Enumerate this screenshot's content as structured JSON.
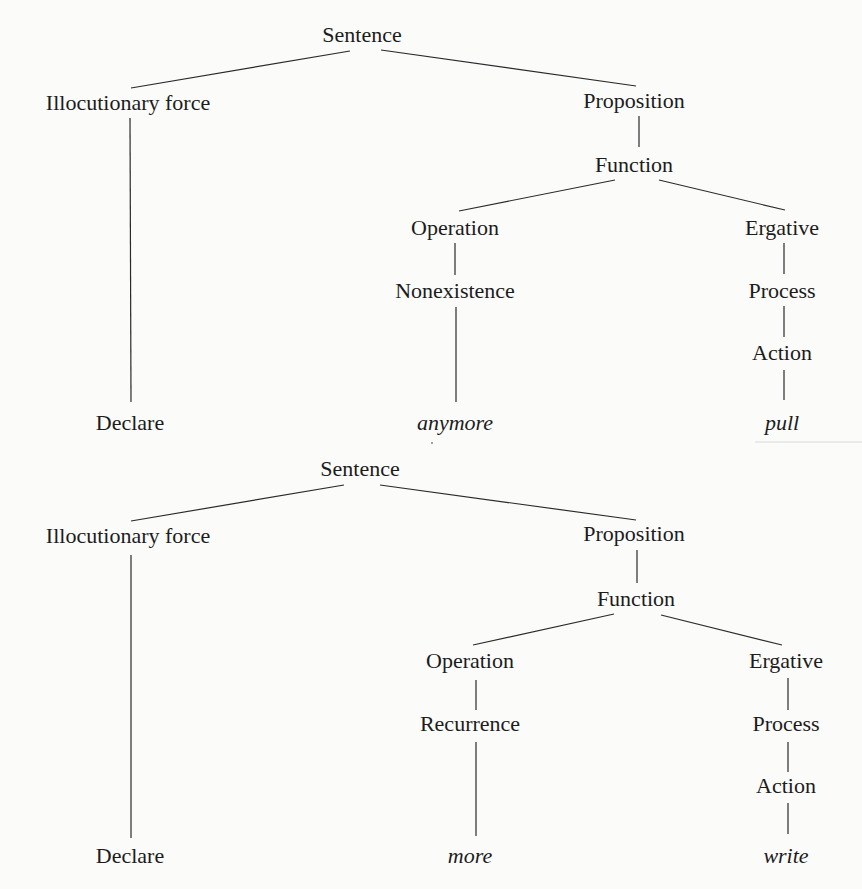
{
  "diagram": {
    "trees": [
      {
        "id": "tree-1",
        "offset_y": 0,
        "nodes": [
          {
            "id": "sentence",
            "label": "Sentence",
            "x": 362,
            "y": 42,
            "italic": false
          },
          {
            "id": "illocutionary-force",
            "label": "Illocutionary force",
            "x": 128,
            "y": 110,
            "italic": false
          },
          {
            "id": "proposition",
            "label": "Proposition",
            "x": 634,
            "y": 108,
            "italic": false
          },
          {
            "id": "function",
            "label": "Function",
            "x": 634,
            "y": 172,
            "italic": false
          },
          {
            "id": "operation",
            "label": "Operation",
            "x": 455,
            "y": 235,
            "italic": false
          },
          {
            "id": "ergative",
            "label": "Ergative",
            "x": 782,
            "y": 235,
            "italic": false
          },
          {
            "id": "nonexistence",
            "label": "Nonexistence",
            "x": 455,
            "y": 298,
            "italic": false
          },
          {
            "id": "process",
            "label": "Process",
            "x": 782,
            "y": 298,
            "italic": false
          },
          {
            "id": "action",
            "label": "Action",
            "x": 782,
            "y": 360,
            "italic": false
          },
          {
            "id": "declare",
            "label": "Declare",
            "x": 130,
            "y": 430,
            "italic": false
          },
          {
            "id": "anymore",
            "label": "anymore",
            "x": 455,
            "y": 430,
            "italic": true
          },
          {
            "id": "pull",
            "label": "pull",
            "x": 782,
            "y": 430,
            "italic": true
          }
        ],
        "edges": [
          {
            "from": "sentence",
            "to": "illocutionary-force",
            "x1": 350,
            "y1": 51,
            "x2": 131,
            "y2": 88
          },
          {
            "from": "sentence",
            "to": "proposition",
            "x1": 381,
            "y1": 50,
            "x2": 636,
            "y2": 86
          },
          {
            "from": "illocutionary-force",
            "to": "declare",
            "x1": 130,
            "y1": 118,
            "x2": 131,
            "y2": 402
          },
          {
            "from": "proposition",
            "to": "function",
            "x1": 639,
            "y1": 116,
            "x2": 639,
            "y2": 147
          },
          {
            "from": "function",
            "to": "operation",
            "x1": 615,
            "y1": 180,
            "x2": 459,
            "y2": 211
          },
          {
            "from": "function",
            "to": "ergative",
            "x1": 659,
            "y1": 180,
            "x2": 785,
            "y2": 210
          },
          {
            "from": "operation",
            "to": "nonexistence",
            "x1": 455,
            "y1": 243,
            "x2": 455,
            "y2": 275
          },
          {
            "from": "ergative",
            "to": "process",
            "x1": 784,
            "y1": 243,
            "x2": 784,
            "y2": 274
          },
          {
            "from": "nonexistence",
            "to": "anymore",
            "x1": 456,
            "y1": 307,
            "x2": 456,
            "y2": 402
          },
          {
            "from": "process",
            "to": "action",
            "x1": 784,
            "y1": 306,
            "x2": 784,
            "y2": 337
          },
          {
            "from": "action",
            "to": "pull",
            "x1": 784,
            "y1": 370,
            "x2": 784,
            "y2": 400
          }
        ]
      },
      {
        "id": "tree-2",
        "offset_y": 0,
        "nodes": [
          {
            "id": "sentence",
            "label": "Sentence",
            "x": 360,
            "y": 476,
            "italic": false
          },
          {
            "id": "illocutionary-force",
            "label": "Illocutionary force",
            "x": 128,
            "y": 543,
            "italic": false
          },
          {
            "id": "proposition",
            "label": "Proposition",
            "x": 634,
            "y": 541,
            "italic": false
          },
          {
            "id": "function",
            "label": "Function",
            "x": 636,
            "y": 606,
            "italic": false
          },
          {
            "id": "operation",
            "label": "Operation",
            "x": 470,
            "y": 668,
            "italic": false
          },
          {
            "id": "ergative",
            "label": "Ergative",
            "x": 786,
            "y": 668,
            "italic": false
          },
          {
            "id": "recurrence",
            "label": "Recurrence",
            "x": 470,
            "y": 731,
            "italic": false
          },
          {
            "id": "process",
            "label": "Process",
            "x": 786,
            "y": 731,
            "italic": false
          },
          {
            "id": "action",
            "label": "Action",
            "x": 786,
            "y": 793,
            "italic": false
          },
          {
            "id": "declare",
            "label": "Declare",
            "x": 130,
            "y": 863,
            "italic": false
          },
          {
            "id": "more",
            "label": "more",
            "x": 470,
            "y": 863,
            "italic": true
          },
          {
            "id": "write",
            "label": "write",
            "x": 786,
            "y": 863,
            "italic": true
          }
        ],
        "edges": [
          {
            "from": "sentence",
            "to": "illocutionary-force",
            "x1": 344,
            "y1": 485,
            "x2": 131,
            "y2": 521
          },
          {
            "from": "sentence",
            "to": "proposition",
            "x1": 380,
            "y1": 485,
            "x2": 636,
            "y2": 520
          },
          {
            "from": "illocutionary-force",
            "to": "declare",
            "x1": 131,
            "y1": 555,
            "x2": 131,
            "y2": 838
          },
          {
            "from": "proposition",
            "to": "function",
            "x1": 637,
            "y1": 550,
            "x2": 637,
            "y2": 583
          },
          {
            "from": "function",
            "to": "operation",
            "x1": 614,
            "y1": 614,
            "x2": 473,
            "y2": 645
          },
          {
            "from": "function",
            "to": "ergative",
            "x1": 661,
            "y1": 615,
            "x2": 782,
            "y2": 645
          },
          {
            "from": "operation",
            "to": "recurrence",
            "x1": 476,
            "y1": 680,
            "x2": 476,
            "y2": 710
          },
          {
            "from": "ergative",
            "to": "process",
            "x1": 788,
            "y1": 678,
            "x2": 788,
            "y2": 710
          },
          {
            "from": "recurrence",
            "to": "more",
            "x1": 476,
            "y1": 742,
            "x2": 476,
            "y2": 836
          },
          {
            "from": "process",
            "to": "action",
            "x1": 788,
            "y1": 742,
            "x2": 788,
            "y2": 772
          },
          {
            "from": "action",
            "to": "write",
            "x1": 788,
            "y1": 803,
            "x2": 788,
            "y2": 834
          }
        ]
      }
    ]
  }
}
